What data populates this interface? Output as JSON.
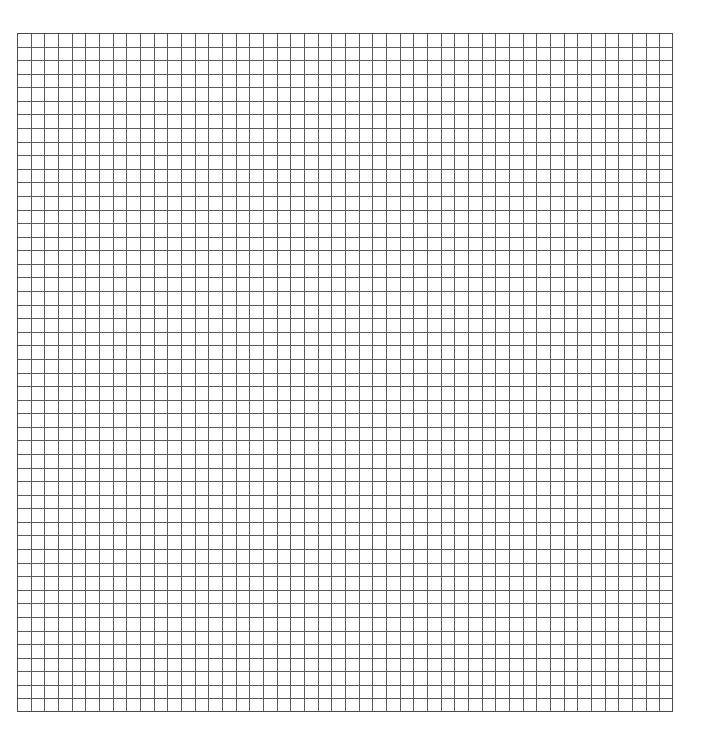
{
  "page": {
    "background_color": "#ffffff",
    "width": 709,
    "height": 739
  },
  "grid": {
    "name": "graph-paper-grid",
    "description": "Empty square grid / graph paper sheet with no plotted content",
    "origin_x": 17,
    "origin_y": 33,
    "right_edge": 673,
    "bottom_edge": 712,
    "area_width": 656,
    "area_height": 679,
    "columns": 48,
    "rows": 50,
    "cell_width": 13.67,
    "cell_height": 13.58,
    "line_color": "#5a5a5a",
    "line_color_light": "#9a9a9a",
    "line_width": 1,
    "border_color": "#4a4a4a",
    "border_width": 1,
    "fill_color": "#ffffff"
  },
  "chart_data": {
    "type": "table",
    "title": "",
    "subtitle": "",
    "xlabel": "",
    "ylabel": "",
    "grid": true,
    "legend": "none",
    "categories": [],
    "values": [],
    "series": [],
    "annotations": [],
    "note": "Blank grid — no data series, tick labels, legend, or annotations are rendered in the image."
  }
}
